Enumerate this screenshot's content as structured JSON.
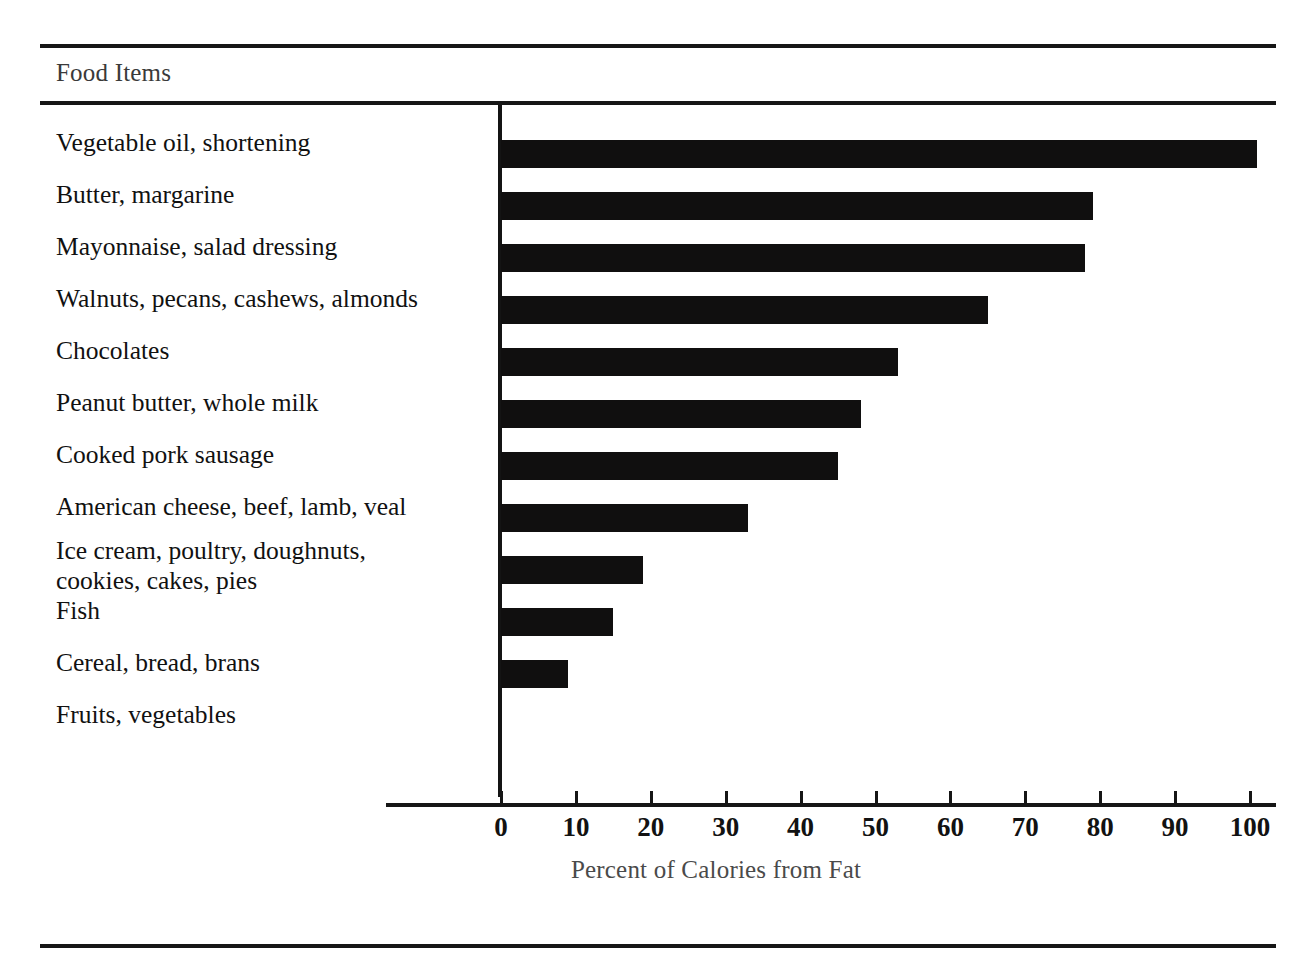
{
  "table": {
    "column_header": "Food Items"
  },
  "chart_data": {
    "type": "bar",
    "orientation": "horizontal",
    "title": "",
    "xlabel": "Percent of Calories from Fat",
    "ylabel": "Food Items",
    "xlim": [
      0,
      100
    ],
    "xticks": [
      0,
      10,
      20,
      30,
      40,
      50,
      60,
      70,
      80,
      90,
      100
    ],
    "grid": false,
    "legend": null,
    "bar_color": "#100f0f",
    "categories": [
      "Vegetable oil, shortening",
      "Butter, margarine",
      "Mayonnaise, salad dressing",
      "Walnuts, pecans, cashews, almonds",
      "Chocolates",
      "Peanut butter, whole milk",
      "Cooked pork sausage",
      "American cheese, beef, lamb, veal",
      "Ice cream, poultry, doughnuts,\ncookies, cakes, pies",
      "Fish",
      "Cereal, bread, brans",
      "Fruits, vegetables"
    ],
    "values": [
      101,
      79,
      78,
      65,
      53,
      48,
      45,
      33,
      19,
      15,
      9,
      0
    ]
  }
}
